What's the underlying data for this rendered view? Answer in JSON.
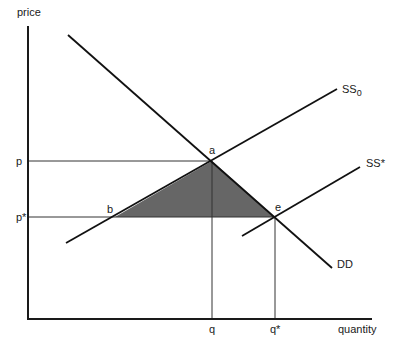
{
  "axes": {
    "y_label": "price",
    "x_label": "quantity"
  },
  "ticks": {
    "p": "p",
    "p_star": "p*",
    "q": "q",
    "q_star": "q*"
  },
  "points": {
    "a": "a",
    "b": "b",
    "e": "e"
  },
  "curves": {
    "ss0_main": "SS",
    "ss0_sub": "0",
    "ss_star": "SS*",
    "dd": "DD"
  },
  "colors": {
    "shaded_area": "#666666",
    "line": "#111111"
  }
}
